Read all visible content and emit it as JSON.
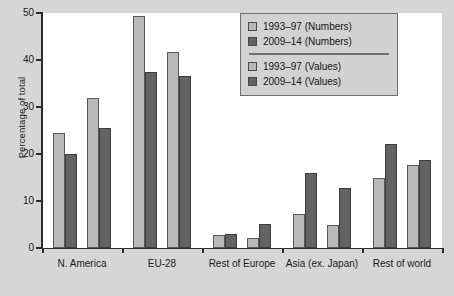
{
  "chart_data": {
    "type": "bar",
    "title": "",
    "subtitle": "",
    "xlabel": "",
    "ylabel": "Percentage of total",
    "ylim": [
      0,
      50
    ],
    "yticks": [
      0,
      10,
      20,
      30,
      40,
      50
    ],
    "ytick_labels": [
      "0",
      "10",
      "20",
      "30",
      "40",
      "50"
    ],
    "grid": false,
    "legend_position": "top-right",
    "categories": [
      "N. America",
      "EU-28",
      "Rest of Europe",
      "Asia (ex. Japan)",
      "Rest of world"
    ],
    "series": [
      {
        "name": "1993–97 (Numbers)",
        "color": "#b9b9b9",
        "values": [
          24.5,
          49.3,
          2.8,
          7.3,
          15.0
        ]
      },
      {
        "name": "2009–14 (Numbers)",
        "color": "#636363",
        "values": [
          20.0,
          37.5,
          3.0,
          16.0,
          22.2
        ]
      },
      {
        "name": "1993–97 (Values)",
        "color": "#b9b9b9",
        "values": [
          32.0,
          41.8,
          2.2,
          5.0,
          17.6
        ]
      },
      {
        "name": "2009–14 (Values)",
        "color": "#636363",
        "values": [
          25.5,
          36.5,
          5.1,
          12.8,
          18.8
        ]
      }
    ],
    "legend": [
      {
        "label": "1993–97 (Numbers)",
        "swatch": "light"
      },
      {
        "label": "2009–14 (Numbers)",
        "swatch": "dark"
      },
      {
        "label": "1993–97 (Values)",
        "swatch": "light"
      },
      {
        "label": "2009–14 (Values)",
        "swatch": "dark"
      }
    ],
    "colors": {
      "light_bar": "#b9b9b9",
      "dark_bar": "#636363",
      "plot_background": "#ffffff",
      "figure_background": "#d6d6d6",
      "axis": "#2b2b2b"
    }
  }
}
